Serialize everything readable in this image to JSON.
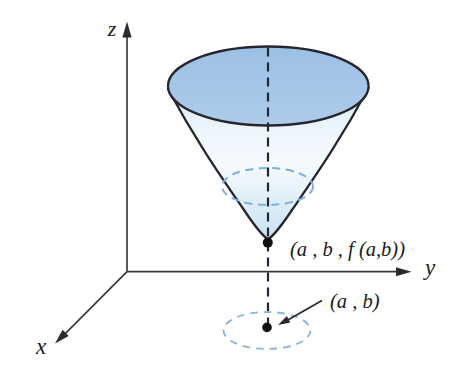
{
  "figure": {
    "axes": {
      "z_label": "z",
      "y_label": "y",
      "x_label": "x"
    },
    "points": {
      "surface_point_label": "(a , b , f (a,b))",
      "domain_point_label": "(a , b)"
    },
    "colors": {
      "background": "#ffffff",
      "cone_top_fill_dark": "#9cc0e5",
      "cone_top_fill_light": "#aecceb",
      "cone_body_light": "#f6fafd",
      "cone_body_shade": "#c9e1f2",
      "outline": "#26262e",
      "axis_stroke": "#3a3a3a",
      "center_dashed_line": "#202838",
      "dashed_level_curve": "#7fb0dd",
      "dashed_domain_circle": "#86b4e0",
      "point_dot": "#101014",
      "text": "#1b1b1b"
    }
  }
}
